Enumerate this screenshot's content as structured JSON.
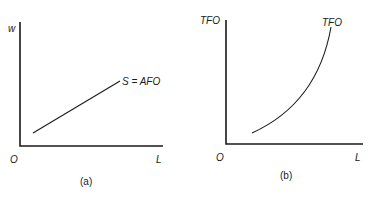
{
  "panels": [
    {
      "id": "a",
      "caption": "(a)",
      "y_axis_label": "w",
      "x_axis_label": "L",
      "origin_label": "O",
      "curve_label": "S = AFO",
      "curve_type": "straight line, upward sloping"
    },
    {
      "id": "b",
      "caption": "(b)",
      "y_axis_label": "TFO",
      "x_axis_label": "L",
      "origin_label": "O",
      "curve_label": "TFO",
      "curve_type": "convex curve, increasing at increasing rate"
    }
  ]
}
